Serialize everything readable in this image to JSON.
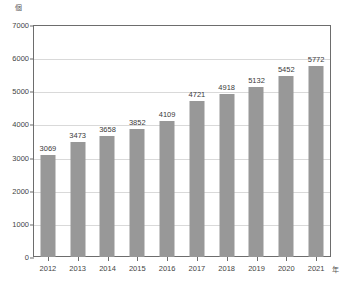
{
  "chart_data": {
    "type": "bar",
    "title": "",
    "subtitle": "",
    "xlabel": "年",
    "ylabel": "個",
    "categories": [
      "2012",
      "2013",
      "2014",
      "2015",
      "2016",
      "2017",
      "2018",
      "2019",
      "2020",
      "2021"
    ],
    "values": [
      3069,
      3473,
      3658,
      3852,
      4109,
      4721,
      4918,
      5132,
      5452,
      5772
    ],
    "value_labels": [
      "3069",
      "3473",
      "3658",
      "3852",
      "4109",
      "4721",
      "4918",
      "5132",
      "5452",
      "5772"
    ],
    "ylim": [
      0,
      7000
    ],
    "ytick_values": [
      0,
      1000,
      2000,
      3000,
      4000,
      5000,
      6000,
      7000
    ],
    "ytick_labels": [
      "0",
      "1000",
      "2000",
      "3000",
      "4000",
      "5000",
      "6000",
      "7000"
    ],
    "grid": true,
    "legend": false,
    "legend_position": "none",
    "bar_color": "#989898",
    "grid_color": "#d9d9d9",
    "axis_color": "#6d6d6d",
    "text_color": "#3a3a3a",
    "background_color": "#ffffff"
  },
  "axes": {
    "y_unit_label": "個",
    "x_unit_label": "年"
  }
}
